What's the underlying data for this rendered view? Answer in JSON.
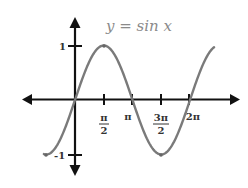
{
  "chart_data": {
    "type": "line",
    "title": "y = sin x",
    "xlabel": "",
    "ylabel": "",
    "function": "sin",
    "x_range": [
      -1.7,
      7.6
    ],
    "xlim": [
      -2.8,
      8.9
    ],
    "ylim": [
      -1.35,
      1.5
    ],
    "grid": false,
    "legend": null,
    "x_ticks": [
      {
        "value": 1.5708,
        "label_num": "π",
        "label_den": "2"
      },
      {
        "value": 3.1416,
        "label": "π"
      },
      {
        "value": 4.7124,
        "label_num": "3π",
        "label_den": "2"
      },
      {
        "value": 6.2832,
        "label": "2π"
      }
    ],
    "y_ticks": [
      {
        "value": 1,
        "label": "1"
      },
      {
        "value": -1,
        "label": "-1"
      }
    ],
    "key_points": [
      {
        "x": -1.5708,
        "y": -1
      },
      {
        "x": 0,
        "y": 0
      },
      {
        "x": 1.5708,
        "y": 1
      },
      {
        "x": 3.1416,
        "y": 0
      },
      {
        "x": 4.7124,
        "y": -1
      },
      {
        "x": 6.2832,
        "y": 0
      },
      {
        "x": 7.5,
        "y": 0.938
      }
    ],
    "colors": {
      "curve": "#7a7a7a",
      "axes": "#111111",
      "title": "#8a8a8a"
    }
  }
}
